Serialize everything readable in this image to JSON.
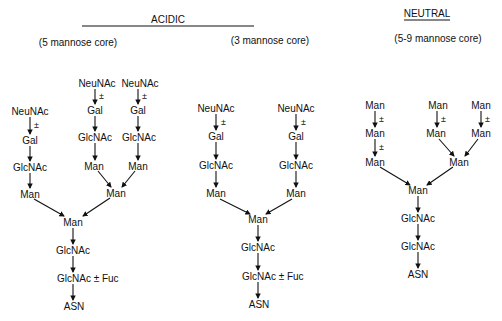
{
  "headers": {
    "acidic": "ACIDIC",
    "neutral": "NEUTRAL",
    "core_5": "(5 mannose core)",
    "core_3": "(3 mannose core)",
    "core_5_9": "(5-9 mannose core)"
  },
  "symbols": {
    "plus_minus": "±"
  },
  "acidic_5": {
    "left_branch": [
      "NeuNAc",
      "Gal",
      "GlcNAc",
      "Man"
    ],
    "upper_branch_a": [
      "NeuNAc",
      "Gal",
      "GlcNAc",
      "Man"
    ],
    "upper_branch_b": [
      "NeuNAc",
      "Gal",
      "GlcNAc",
      "Man"
    ],
    "branch_man": "Man",
    "core": [
      "Man",
      "GlcNAc",
      "GlcNAc ± Fuc",
      "ASN"
    ]
  },
  "acidic_3": {
    "left_branch": [
      "NeuNAc",
      "Gal",
      "GlcNAc",
      "Man"
    ],
    "right_branch": [
      "NeuNAc",
      "Gal",
      "GlcNAc",
      "Man"
    ],
    "core": [
      "Man",
      "GlcNAc",
      "GlcNAc ± Fuc",
      "ASN"
    ]
  },
  "neutral": {
    "left_branch": [
      "Man",
      "Man",
      "Man"
    ],
    "mid_branch": [
      "Man",
      "Man"
    ],
    "right_branch": [
      "Man",
      "Man"
    ],
    "branch_man": "Man",
    "core": [
      "Man",
      "GlcNAc",
      "GlcNAc",
      "ASN"
    ]
  }
}
